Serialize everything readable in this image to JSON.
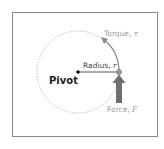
{
  "diagram": {
    "labels": {
      "pivot": "Pivot",
      "radius": "Radius,",
      "radius_symbol": "r",
      "torque": "Torque,",
      "torque_symbol": "τ",
      "force": "Force,",
      "force_symbol": "F"
    },
    "colors": {
      "frame": "#8a8a8a",
      "circle": "#bdbdbd",
      "radius_line": "#555555",
      "force_arrow": "#6e6e6e",
      "torque_arrow": "#8a8a8a"
    }
  }
}
